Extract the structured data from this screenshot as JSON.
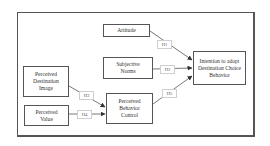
{
  "diagram": {
    "type": "path-model",
    "nodes": [
      {
        "id": "attitude",
        "label": "Attitude"
      },
      {
        "id": "subjective-norms",
        "label": "Subjective Norms"
      },
      {
        "id": "perceived-destination-image",
        "label": "Perceived Destination Image"
      },
      {
        "id": "perceived-value",
        "label": "Perceived Value"
      },
      {
        "id": "perceived-behavior-control",
        "label": "Perceived Behavior Control"
      },
      {
        "id": "intention",
        "label": "Intention to adopt Destination Choice Behavior"
      }
    ],
    "hypotheses": [
      {
        "label": "H1",
        "from": "attitude",
        "to": "intention"
      },
      {
        "label": "H2",
        "from": "subjective-norms",
        "to": "intention"
      },
      {
        "label": "H3",
        "from": "perceived-destination-image",
        "to": "perceived-behavior-control"
      },
      {
        "label": "H4",
        "from": "perceived-value",
        "to": "perceived-behavior-control"
      },
      {
        "label": "H5",
        "from": "perceived-behavior-control",
        "to": "intention"
      }
    ],
    "colors": {
      "border": "#555555",
      "text": "#333333",
      "label_border": "#cfcfcf",
      "background": "#ffffff"
    }
  }
}
